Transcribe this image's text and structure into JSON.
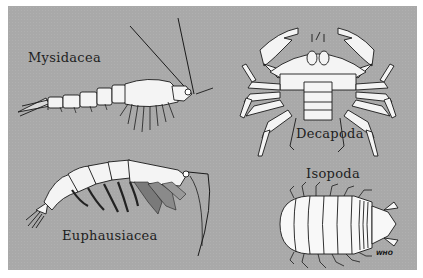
{
  "plate": {
    "background_color": "#a9a9a9",
    "border_color": "#ffffff",
    "specimens": [
      {
        "name": "Mysidacea",
        "drawing": "mysid-shrimp"
      },
      {
        "name": "Decapoda",
        "drawing": "crab"
      },
      {
        "name": "Euphausiacea",
        "drawing": "krill"
      },
      {
        "name": "Isopoda",
        "drawing": "isopod"
      }
    ],
    "signature": "WHO"
  }
}
